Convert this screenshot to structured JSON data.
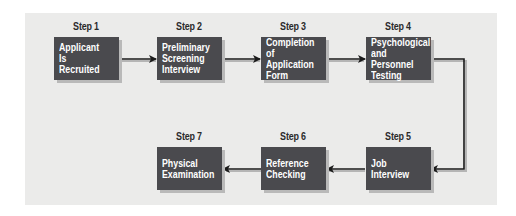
{
  "diagram": {
    "type": "flowchart",
    "colors": {
      "panel": "#ebebea",
      "box": "#4a4a4e",
      "box_text": "#ffffff",
      "arrow": "#1a1a1a"
    },
    "steps": [
      {
        "label": "Step 1",
        "text": "Applicant Is\nRecruited"
      },
      {
        "label": "Step 2",
        "text": "Preliminary\nScreening\nInterview"
      },
      {
        "label": "Step 3",
        "text": "Completion of\nApplication\nForm"
      },
      {
        "label": "Step 4",
        "text": "Psychological\nand Personnel\nTesting"
      },
      {
        "label": "Step 5",
        "text": "Job\nInterview"
      },
      {
        "label": "Step 6",
        "text": "Reference\nChecking"
      },
      {
        "label": "Step 7",
        "text": "Physical\nExamination"
      }
    ],
    "edges": [
      [
        "Step 1",
        "Step 2"
      ],
      [
        "Step 2",
        "Step 3"
      ],
      [
        "Step 3",
        "Step 4"
      ],
      [
        "Step 4",
        "Step 5"
      ],
      [
        "Step 5",
        "Step 6"
      ],
      [
        "Step 6",
        "Step 7"
      ]
    ]
  }
}
